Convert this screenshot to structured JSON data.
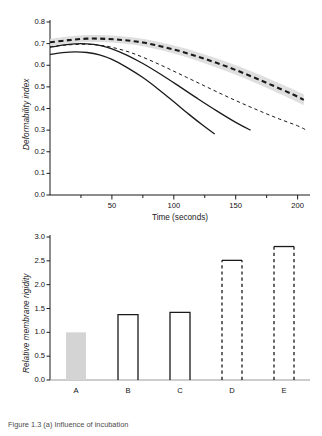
{
  "figure": {
    "caption": "Figure 1.3 (a) Influence of incubation"
  },
  "chart_data": [
    {
      "type": "line",
      "panel": "top",
      "title": "",
      "xlabel": "Time (seconds)",
      "ylabel": "Deformability index",
      "xlim": [
        0,
        210
      ],
      "ylim": [
        0.0,
        0.8
      ],
      "grid": false,
      "legend_position": "none",
      "xticks": [
        50,
        100,
        150,
        200
      ],
      "xtick_labels": [
        "50",
        "100",
        "150",
        "200"
      ],
      "xminor_ticks": [
        25,
        75,
        125,
        175
      ],
      "yticks": [
        0.0,
        0.1,
        0.2,
        0.3,
        0.4,
        0.5,
        0.6,
        0.7,
        0.8
      ],
      "ytick_labels": [
        "0.0",
        "0.1",
        "0.2",
        "0.3",
        "0.4",
        "0.5",
        "0.6",
        "0.7",
        "0.8"
      ],
      "band": {
        "name": "control-confidence-band",
        "color": "#d9d9d9",
        "x": [
          0,
          15,
          30,
          45,
          60,
          75,
          90,
          105,
          120,
          135,
          150,
          165,
          180,
          195,
          205
        ],
        "upper": [
          0.722,
          0.733,
          0.74,
          0.739,
          0.733,
          0.722,
          0.705,
          0.684,
          0.659,
          0.631,
          0.6,
          0.566,
          0.53,
          0.492,
          0.465
        ],
        "lower": [
          0.69,
          0.7,
          0.707,
          0.706,
          0.7,
          0.688,
          0.669,
          0.646,
          0.619,
          0.589,
          0.556,
          0.52,
          0.482,
          0.443,
          0.415
        ]
      },
      "series": [
        {
          "name": "curve-thick-dashed-control",
          "style": "dashed",
          "width": 2.1,
          "color": "#1a1a1a",
          "x": [
            0,
            15,
            30,
            45,
            60,
            75,
            90,
            105,
            120,
            135,
            150,
            165,
            180,
            195,
            205
          ],
          "y": [
            0.706,
            0.716,
            0.723,
            0.722,
            0.716,
            0.705,
            0.687,
            0.665,
            0.639,
            0.61,
            0.578,
            0.543,
            0.506,
            0.468,
            0.44
          ]
        },
        {
          "name": "curve-thin-dashed",
          "style": "dashed",
          "width": 1.0,
          "color": "#1a1a1a",
          "x": [
            0,
            12,
            25,
            38,
            50,
            65,
            80,
            95,
            110,
            125,
            140,
            155,
            170,
            185,
            200,
            207
          ],
          "y": [
            0.686,
            0.693,
            0.697,
            0.694,
            0.683,
            0.659,
            0.625,
            0.586,
            0.545,
            0.504,
            0.463,
            0.424,
            0.387,
            0.352,
            0.32,
            0.3
          ]
        },
        {
          "name": "curve-solid-upper",
          "style": "solid",
          "width": 1.3,
          "color": "#1a1a1a",
          "x": [
            0,
            10,
            20,
            30,
            40,
            50,
            62,
            75,
            90,
            105,
            120,
            135,
            150,
            162
          ],
          "y": [
            0.683,
            0.693,
            0.699,
            0.699,
            0.692,
            0.676,
            0.647,
            0.608,
            0.556,
            0.5,
            0.443,
            0.388,
            0.336,
            0.3
          ]
        },
        {
          "name": "curve-solid-lower",
          "style": "solid",
          "width": 1.3,
          "color": "#1a1a1a",
          "x": [
            0,
            10,
            20,
            30,
            40,
            50,
            62,
            75,
            88,
            100,
            112,
            124,
            133
          ],
          "y": [
            0.65,
            0.658,
            0.662,
            0.659,
            0.648,
            0.627,
            0.59,
            0.543,
            0.487,
            0.431,
            0.374,
            0.32,
            0.282
          ]
        }
      ]
    },
    {
      "type": "bar",
      "panel": "bottom",
      "title": "",
      "xlabel": "",
      "ylabel": "Relative membrane rigidity",
      "ylim": [
        0.0,
        3.0
      ],
      "grid": false,
      "legend_position": "none",
      "categories": [
        "A",
        "B",
        "C",
        "D",
        "E"
      ],
      "values": [
        1.0,
        1.37,
        1.42,
        2.51,
        2.8
      ],
      "yticks": [
        0.0,
        0.5,
        1.0,
        1.5,
        2.0,
        2.5,
        3.0
      ],
      "ytick_labels": [
        "0.0",
        "0.5",
        "1.0",
        "1.5",
        "2.0",
        "2.5",
        "3.0"
      ],
      "bar_styles": [
        "filled-gray",
        "solid-outline",
        "solid-outline",
        "dashed-outline",
        "dashed-outline"
      ],
      "bar_fill": "#d4d4d4",
      "bar_edge": "#1a1a1a"
    }
  ]
}
